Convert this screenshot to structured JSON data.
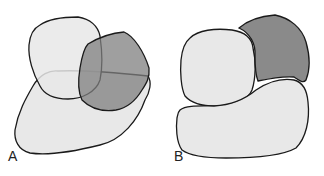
{
  "panels": [
    {
      "label": "A",
      "description": "Three overlapping irregular shapes: two light, one dark"
    },
    {
      "label": "B",
      "description": "Three non-overlapping adjacent shapes: two light, one dark"
    }
  ],
  "colors": {
    "light_fill": "#e6e6e6",
    "dark_fill": "#8a8a8a",
    "overlap_fill": "#bdbdbd",
    "stroke": "#1a1a1a"
  }
}
